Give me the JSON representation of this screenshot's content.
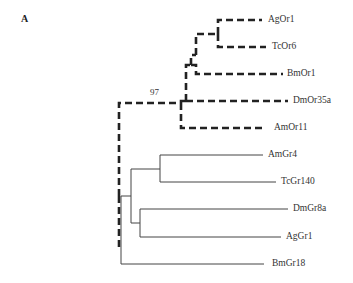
{
  "figure": {
    "panel_label": "A",
    "bootstrap_value": "97"
  },
  "tree": {
    "or_clade": {
      "style": "dashed",
      "leaves": [
        {
          "name": "AgOr1",
          "x": 268,
          "y": 20
        },
        {
          "name": "TcOr6",
          "x": 272,
          "y": 47
        },
        {
          "name": "BmOr1",
          "x": 287,
          "y": 74
        },
        {
          "name": "DmOr35a",
          "x": 293,
          "y": 101
        },
        {
          "name": "AmOr11",
          "x": 274,
          "y": 128
        }
      ]
    },
    "gr_clade": {
      "style": "solid",
      "leaves": [
        {
          "name": "AmGr4",
          "x": 268,
          "y": 155
        },
        {
          "name": "TcGr140",
          "x": 281,
          "y": 182
        },
        {
          "name": "DmGr8a",
          "x": 293,
          "y": 209
        },
        {
          "name": "AgGr1",
          "x": 286,
          "y": 237
        },
        {
          "name": "BmGr18",
          "x": 272,
          "y": 264
        }
      ]
    }
  }
}
